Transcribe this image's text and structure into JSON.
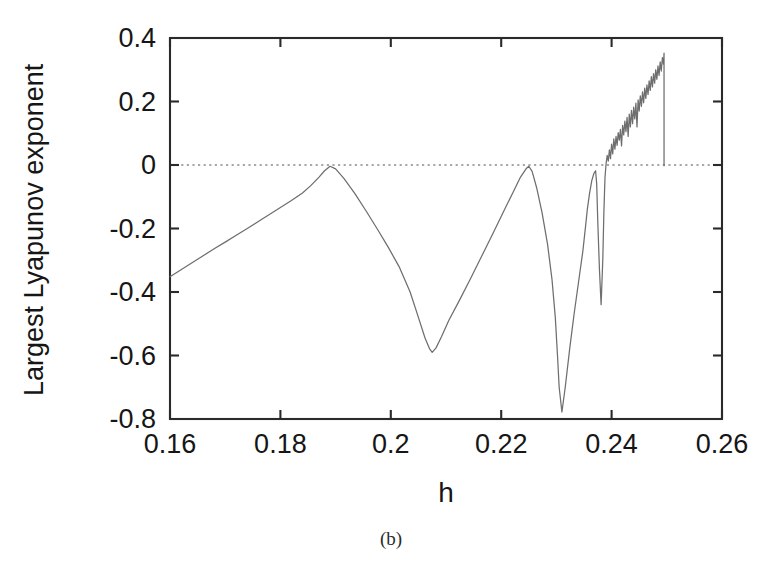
{
  "figure": {
    "caption": "(b)"
  },
  "chart_data": {
    "type": "line",
    "title": "",
    "xlabel": "h",
    "ylabel": "Largest Lyapunov exponent",
    "xlim": [
      0.16,
      0.26
    ],
    "ylim": [
      -0.8,
      0.4
    ],
    "xticks": [
      0.16,
      0.18,
      0.2,
      0.22,
      0.24,
      0.26
    ],
    "xtick_labels": [
      "0.16",
      "0.18",
      "0.2",
      "0.22",
      "0.24",
      "0.26"
    ],
    "yticks": [
      -0.8,
      -0.6,
      -0.4,
      -0.2,
      0,
      0.2,
      0.4
    ],
    "ytick_labels": [
      "-0.8",
      "-0.6",
      "-0.4",
      "-0.2",
      "0",
      "0.2",
      "0.4"
    ],
    "grid": false,
    "legend": null,
    "reference_lines": [
      {
        "name": "zero-line",
        "axis": "y",
        "value": 0,
        "style": "dotted",
        "color": "#8c8c8c"
      }
    ],
    "series": [
      {
        "name": "Largest Lyapunov exponent",
        "color": "#6e6e6e",
        "x": [
          0.16,
          0.162,
          0.164,
          0.166,
          0.168,
          0.17,
          0.172,
          0.174,
          0.176,
          0.178,
          0.18,
          0.182,
          0.184,
          0.1855,
          0.187,
          0.188,
          0.189,
          0.19,
          0.1915,
          0.1935,
          0.1955,
          0.1975,
          0.1995,
          0.2015,
          0.2035,
          0.205,
          0.2062,
          0.207,
          0.2075,
          0.2082,
          0.2092,
          0.2105,
          0.2125,
          0.2145,
          0.2165,
          0.2185,
          0.2205,
          0.2222,
          0.2235,
          0.2245,
          0.225,
          0.2256,
          0.2264,
          0.2274,
          0.2284,
          0.2292,
          0.2298,
          0.2302,
          0.2305,
          0.231,
          0.2316,
          0.2324,
          0.2332,
          0.234,
          0.2348,
          0.2353,
          0.2356,
          0.236,
          0.2364,
          0.2368,
          0.2371,
          0.2373,
          0.2375,
          0.2378,
          0.2381,
          0.2384,
          0.2386,
          0.2388,
          0.239,
          0.2392,
          0.2394,
          0.2396,
          0.2398,
          0.24,
          0.2402,
          0.2404,
          0.2406,
          0.2408,
          0.241,
          0.2412,
          0.2414,
          0.2416,
          0.2418,
          0.242,
          0.2422,
          0.2424,
          0.2426,
          0.2428,
          0.243,
          0.2432,
          0.2434,
          0.2436,
          0.2438,
          0.244,
          0.2442,
          0.2444,
          0.2446,
          0.2448,
          0.245,
          0.2452,
          0.2454,
          0.2456,
          0.2458,
          0.246,
          0.2462,
          0.2464,
          0.2466,
          0.2468,
          0.247,
          0.2472,
          0.2474,
          0.2476,
          0.2478,
          0.248,
          0.2482,
          0.2484,
          0.2486,
          0.2488,
          0.249,
          0.2492,
          0.2494,
          0.2495,
          0.2495
        ],
        "y": [
          -0.352,
          -0.33,
          -0.308,
          -0.286,
          -0.264,
          -0.243,
          -0.221,
          -0.2,
          -0.178,
          -0.156,
          -0.134,
          -0.112,
          -0.088,
          -0.065,
          -0.038,
          -0.018,
          -0.004,
          -0.012,
          -0.042,
          -0.09,
          -0.144,
          -0.2,
          -0.258,
          -0.32,
          -0.4,
          -0.48,
          -0.545,
          -0.578,
          -0.59,
          -0.576,
          -0.54,
          -0.49,
          -0.424,
          -0.356,
          -0.286,
          -0.216,
          -0.144,
          -0.084,
          -0.038,
          -0.012,
          -0.004,
          -0.02,
          -0.07,
          -0.15,
          -0.25,
          -0.36,
          -0.48,
          -0.6,
          -0.7,
          -0.778,
          -0.7,
          -0.58,
          -0.47,
          -0.37,
          -0.27,
          -0.19,
          -0.14,
          -0.09,
          -0.05,
          -0.026,
          -0.018,
          -0.06,
          -0.18,
          -0.33,
          -0.44,
          -0.3,
          -0.15,
          -0.04,
          0.004,
          0.03,
          0.012,
          0.048,
          0.02,
          0.066,
          0.035,
          0.082,
          0.05,
          0.09,
          0.062,
          0.102,
          0.078,
          0.112,
          0.06,
          0.125,
          0.095,
          0.138,
          0.105,
          0.15,
          0.09,
          0.16,
          0.12,
          0.172,
          0.13,
          0.182,
          0.145,
          0.195,
          0.12,
          0.205,
          0.17,
          0.218,
          0.185,
          0.23,
          0.196,
          0.242,
          0.21,
          0.252,
          0.222,
          0.265,
          0.235,
          0.278,
          0.246,
          0.288,
          0.258,
          0.3,
          0.27,
          0.312,
          0.282,
          0.325,
          0.296,
          0.338,
          0.318,
          0.352,
          -0.002
        ]
      }
    ]
  }
}
